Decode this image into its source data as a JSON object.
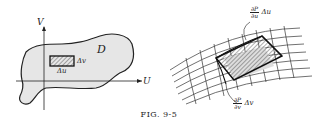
{
  "figure": {
    "caption": "FIG. 9-5",
    "left_panel": {
      "axis_u_label": "U",
      "axis_v_label": "V",
      "region_label": "D",
      "rect_width_label": "Δu",
      "rect_height_label": "Δv"
    },
    "right_panel": {
      "top_annotation": {
        "numerator": "∂P",
        "denominator": "∂u",
        "suffix": "Δu"
      },
      "bottom_annotation": {
        "numerator": "∂P",
        "denominator": "∂v",
        "suffix": "Δv"
      }
    }
  }
}
